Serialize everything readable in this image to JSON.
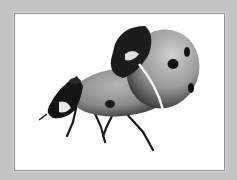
{
  "header": {
    "caption_fragment": "",
    "note": "text cut off at top edge; only descenders visible"
  },
  "photo": {
    "subject": "two mating ladybugs",
    "style": "grayscale",
    "background_color": "#ffffff",
    "frame_color": "#c4c4c4",
    "border_color": "#8e8e8e"
  }
}
